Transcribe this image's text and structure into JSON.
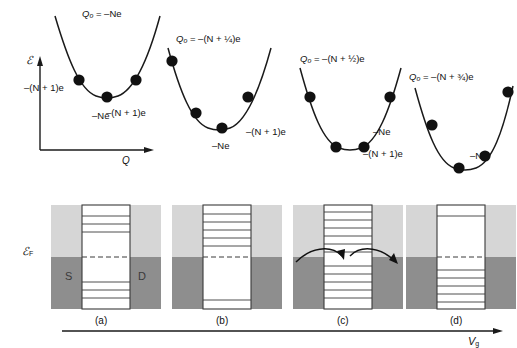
{
  "figure": {
    "axes": {
      "upper_y_label": "ℰ",
      "upper_x_label": "Q",
      "lower_y_label": "ℰ",
      "lower_y_label_sub": "F",
      "lower_x_label": "V",
      "lower_x_label_sub": "g"
    },
    "parabolas": [
      {
        "id": "parabola-a",
        "charge_label": "Q",
        "charge_label_sub": "o",
        "equation": "= –Ne",
        "full_equation": "Qₒ = –Ne",
        "offset_fraction": 0,
        "left_state_label": "–(N + 1)e",
        "vertex_state_label": "–Ne",
        "dots": 3
      },
      {
        "id": "parabola-b",
        "charge_label": "Q",
        "charge_label_sub": "o",
        "equation": "= –(N + ¼)e",
        "full_equation": "Qₒ = –(N + ¼)e",
        "offset_fraction": 0.25,
        "left_state_label": "–(N + 1)e",
        "vertex_state_label": "–Ne",
        "dots": 4
      },
      {
        "id": "parabola-c",
        "charge_label": "Q",
        "charge_label_sub": "o",
        "equation": "= –(N + ½)e",
        "full_equation": "Qₒ = –(N + ½)e",
        "offset_fraction": 0.5,
        "left_state_label": "–(N + 1)e",
        "vertex_state_label": "–Ne",
        "dots": 4
      },
      {
        "id": "parabola-d",
        "charge_label": "Q",
        "charge_label_sub": "o",
        "equation": "= –(N + ¾)e",
        "full_equation": "Qₒ = –(N + ¾)e",
        "offset_fraction": 0.75,
        "left_state_label": "–(N + 1)e",
        "vertex_state_label": "–Ne",
        "dots": 4
      }
    ],
    "panels": [
      {
        "id": "panel-a",
        "caption": "(a)",
        "source_label": "S",
        "drain_label": "D",
        "levels_above": 3,
        "levels_below": 3,
        "blockade": true,
        "arrows": false
      },
      {
        "id": "panel-b",
        "caption": "(b)",
        "source_label": "",
        "drain_label": "",
        "levels_above": 6,
        "levels_below": 1,
        "blockade": true,
        "arrows": false
      },
      {
        "id": "panel-c",
        "caption": "(c)",
        "source_label": "",
        "drain_label": "",
        "levels_above": 6,
        "levels_below": 7,
        "blockade": false,
        "arrows": true
      },
      {
        "id": "panel-d",
        "caption": "(d)",
        "source_label": "",
        "drain_label": "",
        "levels_above": 1,
        "levels_below": 5,
        "blockade": true,
        "arrows": false
      }
    ],
    "colors": {
      "light_band": "#d6d6d6",
      "dark_band": "#8e8e8e",
      "line": "#1a1a1a",
      "channel_fill": "#ffffff",
      "background": "#ffffff"
    }
  }
}
